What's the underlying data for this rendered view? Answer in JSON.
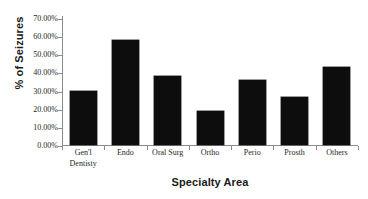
{
  "chart_data": {
    "type": "bar",
    "title": "",
    "subtitle": "",
    "xlabel": "Specialty Area",
    "ylabel": "% of Seizures",
    "categories": [
      "Gen'l Dentisty",
      "Endo",
      "Oral Surg",
      "Ortho",
      "Perio",
      "Prosth",
      "Others"
    ],
    "category_lines": [
      [
        "Gen'l",
        "Dentisty"
      ],
      [
        "Endo"
      ],
      [
        "Oral Surg"
      ],
      [
        "Ortho"
      ],
      [
        "Perio"
      ],
      [
        "Prosth"
      ],
      [
        "Others"
      ]
    ],
    "values": [
      29.8,
      58.0,
      38.0,
      18.7,
      35.8,
      26.5,
      43.0
    ],
    "value_labels": [
      "29.80%",
      "58.00%",
      "38.00%",
      "18.70%",
      "35.80%",
      "26.50%",
      "43.00%"
    ],
    "ylim": [
      0,
      70
    ],
    "ytick_values": [
      0,
      10,
      20,
      30,
      40,
      50,
      60,
      70
    ],
    "ytick_labels": [
      "70.00%",
      "60.00%",
      "50.00%",
      "40.00%",
      "30.00%",
      "20.00%",
      "10.00%",
      "0.00%"
    ],
    "grid": false,
    "legend": null,
    "legend_position": "none",
    "bar_color": "#0d0d0d",
    "axis_color": "#8c8c8c",
    "background_color": "#ffffff",
    "series": [
      {
        "name": "% of Seizures",
        "values": [
          29.8,
          58.0,
          38.0,
          18.7,
          35.8,
          26.5,
          43.0
        ]
      }
    ]
  }
}
